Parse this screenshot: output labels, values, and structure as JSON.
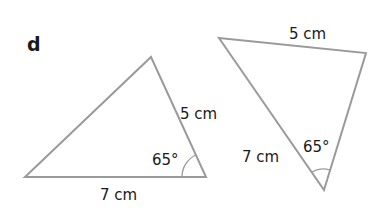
{
  "part_label": "d",
  "colors": {
    "line": "#9a9a9a",
    "text": "#1a1a1a"
  },
  "triangles": [
    {
      "id": "left",
      "side_top_right": "5 cm",
      "side_bottom": "7 cm",
      "angle": "65°"
    },
    {
      "id": "right",
      "side_top": "5 cm",
      "side_left": "7 cm",
      "angle": "65°"
    }
  ]
}
